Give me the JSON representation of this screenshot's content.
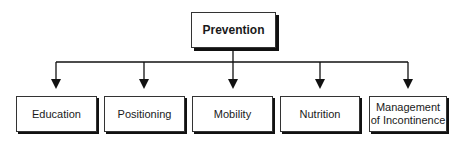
{
  "diagram": {
    "type": "hierarchy",
    "root": {
      "label": "Prevention"
    },
    "children": [
      {
        "label": "Education"
      },
      {
        "label": "Positioning"
      },
      {
        "label": "Mobility"
      },
      {
        "label": "Nutrition"
      },
      {
        "label": "Management of Incontinence",
        "line1": "Management",
        "line2": "of Incontinence"
      }
    ],
    "colors": {
      "line": "#111111",
      "box_border": "#333333",
      "shadow": "#111111",
      "background": "#ffffff"
    }
  }
}
